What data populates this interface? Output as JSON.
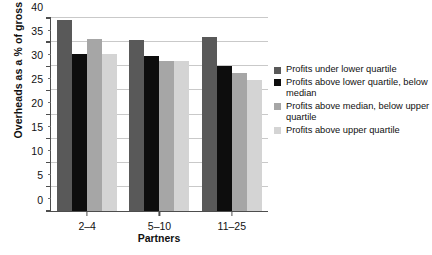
{
  "chart_data": {
    "type": "bar",
    "title": "",
    "xlabel": "Partners",
    "ylabel": "Overheads as a % of gross fees",
    "categories": [
      "2–4",
      "5–10",
      "11–25"
    ],
    "ylim": [
      0,
      40
    ],
    "yticks": [
      0,
      5,
      10,
      15,
      20,
      25,
      30,
      35,
      40
    ],
    "ytick_labels": [
      "0",
      "5",
      "10",
      "15",
      "20",
      "25",
      "30",
      "35",
      "40"
    ],
    "minor_tick_step": 2.5,
    "grid": "horizontal",
    "legend_position": "right",
    "series": [
      {
        "name": "Profits under lower quartile",
        "color": "#595959",
        "values": [
          39.3,
          35.2,
          35.9
        ]
      },
      {
        "name": "Profits above lower quartile, below median",
        "color": "#0d0d0d",
        "values": [
          32.3,
          32.0,
          29.8
        ]
      },
      {
        "name": "Profits above median, below upper quartile",
        "color": "#a6a6a6",
        "values": [
          35.4,
          31.0,
          28.4
        ]
      },
      {
        "name": "Profits above upper quartile",
        "color": "#d4d4d4",
        "values": [
          32.3,
          31.0,
          27.0
        ]
      }
    ]
  },
  "legend": {
    "entries": [
      {
        "label": "Profits under lower quartile",
        "color": "#595959"
      },
      {
        "label": "Profits above lower quartile, below median",
        "color": "#0d0d0d"
      },
      {
        "label": "Profits above median, below upper quartile",
        "color": "#a6a6a6"
      },
      {
        "label": "Profits above upper quartile",
        "color": "#d4d4d4"
      }
    ]
  },
  "axes": {
    "x_title": "Partners",
    "y_title": "Overheads as a % of gross fees"
  }
}
